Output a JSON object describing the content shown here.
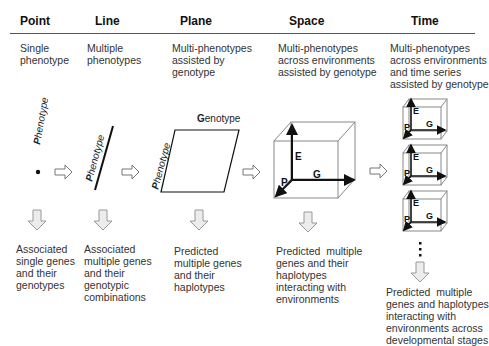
{
  "columns": [
    {
      "title": "Point",
      "description": "Single\nphenotype",
      "outcome": "Associated\nsingle genes\nand their\ngenotypes"
    },
    {
      "title": "Line",
      "description": "Multiple\nphenotypes",
      "outcome": "Associated\nmultiple genes\nand their\ngenotypic\ncombinations"
    },
    {
      "title": "Plane",
      "description": "Multi-phenotypes\nassisted by\ngenotype",
      "outcome": "Predicted\nmultiple genes\nand their\nhaplotypes"
    },
    {
      "title": "Space",
      "description": "Multi-phenotypes\nacross environments\nassisted by genotype",
      "outcome": "Predicted  multiple\ngenes and their\nhaplotypes\ninteracting with\nenvironments"
    },
    {
      "title": "Time",
      "description": "Multi-phenotypes\nacross environments\nand time series\nassisted by genotype",
      "outcome": "Predicted  multiple\ngenes and haplotypes\ninteracting with\nenvironments across\ndevelopmental stages"
    }
  ],
  "axis_labels": {
    "phenotype": "Phenotype",
    "genotype": "Genotype",
    "cube_e": "E",
    "cube_g": "G",
    "cube_p": "P"
  },
  "colors": {
    "line": "#111111",
    "arrow_fill": "#e8e8e8",
    "arrow_stroke": "#888888",
    "cube_edge": "#777777"
  }
}
